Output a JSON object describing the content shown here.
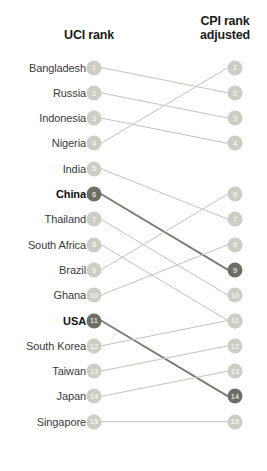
{
  "header": {
    "left_title": "UCI rank",
    "right_title": "CPI rank\nadjusted",
    "right_title_line1": "CPI rank",
    "right_title_line2": "adjusted"
  },
  "colors": {
    "node_default": "#cdcdc5",
    "node_highlight": "#6e6e66",
    "line_default": "#c3c3bb",
    "line_highlight": "#7b7b72",
    "label_text": "#3b3b3b",
    "label_text_bold": "#111111",
    "background": "#ffffff"
  },
  "chart_data": {
    "type": "line",
    "subtype": "slopegraph",
    "title": "",
    "xlabel": "",
    "ylabel": "",
    "axis_left_label": "UCI rank",
    "axis_right_label": "CPI rank adjusted",
    "x": [
      "UCI rank",
      "CPI rank adjusted"
    ],
    "ylim": [
      1,
      15
    ],
    "y_inverted": true,
    "grid": false,
    "legend": "none",
    "categories": [
      "Bangladesh",
      "Russia",
      "Indonesia",
      "Nigeria",
      "India",
      "China",
      "Thailand",
      "South Africa",
      "Brazil",
      "Ghana",
      "USA",
      "South Korea",
      "Taiwan",
      "Japan",
      "Singapore"
    ],
    "series": [
      {
        "name": "UCI rank",
        "values": [
          1,
          2,
          3,
          4,
          5,
          6,
          7,
          8,
          9,
          10,
          11,
          12,
          13,
          14,
          15
        ]
      },
      {
        "name": "CPI rank adjusted",
        "values": [
          2,
          3,
          4,
          1,
          7,
          9,
          10,
          11,
          6,
          8,
          14,
          11,
          12,
          13,
          15
        ]
      }
    ],
    "rows": [
      {
        "label": "Bangladesh",
        "left_rank": 1,
        "right_rank": 2,
        "highlight": false
      },
      {
        "label": "Russia",
        "left_rank": 2,
        "right_rank": 3,
        "highlight": false
      },
      {
        "label": "Indonesia",
        "left_rank": 3,
        "right_rank": 4,
        "highlight": false
      },
      {
        "label": "Nigeria",
        "left_rank": 4,
        "right_rank": 1,
        "highlight": false
      },
      {
        "label": "India",
        "left_rank": 5,
        "right_rank": 7,
        "highlight": false
      },
      {
        "label": "China",
        "left_rank": 6,
        "right_rank": 9,
        "highlight": true
      },
      {
        "label": "Thailand",
        "left_rank": 7,
        "right_rank": 10,
        "highlight": false
      },
      {
        "label": "South Africa",
        "left_rank": 8,
        "right_rank": 11,
        "highlight": false
      },
      {
        "label": "Brazil",
        "left_rank": 9,
        "right_rank": 6,
        "highlight": false
      },
      {
        "label": "Ghana",
        "left_rank": 10,
        "right_rank": 8,
        "highlight": false
      },
      {
        "label": "USA",
        "left_rank": 11,
        "right_rank": 14,
        "highlight": true
      },
      {
        "label": "South Korea",
        "left_rank": 12,
        "right_rank": 11,
        "highlight": false
      },
      {
        "label": "Taiwan",
        "left_rank": 13,
        "right_rank": 12,
        "highlight": false
      },
      {
        "label": "Japan",
        "left_rank": 14,
        "right_rank": 13,
        "highlight": false
      },
      {
        "label": "Singapore",
        "left_rank": 15,
        "right_rank": 15,
        "highlight": false
      }
    ]
  }
}
